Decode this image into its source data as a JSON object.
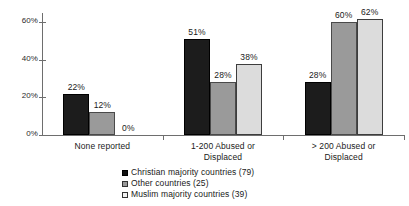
{
  "chart_data": {
    "type": "bar",
    "title": "",
    "subtitle": "",
    "xlabel": "",
    "ylabel": "",
    "ylim": [
      0,
      65
    ],
    "yticks": [
      "0%",
      "20%",
      "40%",
      "60%"
    ],
    "ytick_values": [
      0,
      20,
      40,
      60
    ],
    "grid": false,
    "legend_position": "bottom-center",
    "categories": [
      "None reported",
      "1-200 Abused or Displaced",
      "> 200 Abused or Displaced"
    ],
    "category_lines": [
      [
        "None reported"
      ],
      [
        "1-200 Abused or",
        "Displaced"
      ],
      [
        "> 200 Abused or",
        "Displaced"
      ]
    ],
    "series": [
      {
        "name": "Christian majority countries (79)",
        "color": "#1c1c1c",
        "values": [
          22,
          51,
          28
        ],
        "labels": [
          "22%",
          "51%",
          "28%"
        ]
      },
      {
        "name": "Other countries (25)",
        "color": "#9a9a9a",
        "values": [
          12,
          28,
          60
        ],
        "labels": [
          "12%",
          "28%",
          "60%"
        ]
      },
      {
        "name": "Muslim majority countries (39)",
        "color": "#dcdcdc",
        "values": [
          0,
          38,
          62
        ],
        "labels": [
          "0%",
          "38%",
          "62%"
        ]
      }
    ]
  },
  "axis": {
    "y_tick_labels": [
      "60%",
      "40%",
      "20%",
      "0%"
    ]
  },
  "legend": {
    "items": [
      {
        "label": "Christian majority countries (79)",
        "swatch": "legend-swatch-black"
      },
      {
        "label": "Other countries (25)",
        "swatch": "legend-swatch-gray"
      },
      {
        "label": "Muslim majority countries (39)",
        "swatch": "legend-swatch-light"
      }
    ]
  }
}
